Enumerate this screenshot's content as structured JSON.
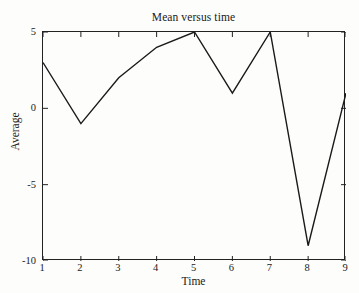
{
  "chart_data": {
    "type": "line",
    "title": "Mean versus time",
    "xlabel": "Time",
    "ylabel": "Average",
    "x": [
      1,
      2,
      3,
      4,
      5,
      6,
      7,
      8,
      9
    ],
    "values": [
      3,
      -1,
      2,
      4,
      5,
      1,
      5,
      -9,
      1
    ],
    "series": [
      {
        "name": "Average",
        "values": [
          3,
          -1,
          2,
          4,
          5,
          1,
          5,
          -9,
          1
        ]
      }
    ],
    "xlim": [
      1,
      9
    ],
    "ylim": [
      -10,
      5
    ],
    "xticks": [
      1,
      2,
      3,
      4,
      5,
      6,
      7,
      8,
      9
    ],
    "xtick_labels": [
      "1",
      "2",
      "3",
      "4",
      "5",
      "6",
      "7",
      "8",
      "9"
    ],
    "yticks": [
      5,
      0,
      -5,
      -10
    ],
    "ytick_labels": [
      "5",
      "0",
      "-5",
      "-10"
    ],
    "grid": false,
    "legend": null,
    "line_color": "#1a1a1a",
    "line_width": 1.4,
    "markers": false,
    "background_color": "#fdfdfc",
    "axis_color": "#222222"
  }
}
